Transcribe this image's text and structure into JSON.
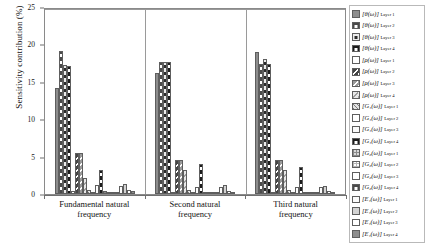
{
  "chart_data": {
    "type": "bar",
    "title": "",
    "xlabel": "",
    "ylabel": "Sensitivity contribution (%)",
    "ylim": [
      0,
      25
    ],
    "yticks": [
      0,
      5,
      10,
      15,
      20,
      25
    ],
    "grid": false,
    "legend_position": "right",
    "categories": [
      "Fundamental natural frequency",
      "Second natural frequency",
      "Third natural frequency"
    ],
    "series": [
      {
        "name": "[θ(ω)]_Layer 1",
        "base": "θ(ω)",
        "layer": "Layer 1",
        "fill": "grey-solid",
        "values": [
          14.3,
          16.4,
          19.2
        ]
      },
      {
        "name": "[θ(ω)]_Layer 2",
        "base": "θ(ω)",
        "layer": "Layer 2",
        "fill": "dark-dots",
        "values": [
          19.3,
          17.9,
          17.6
        ]
      },
      {
        "name": "[θ(ω)]_Layer 3",
        "base": "θ(ω)",
        "layer": "Layer 3",
        "fill": "white-dots",
        "values": [
          17.5,
          17.9,
          18.2
        ]
      },
      {
        "name": "[θ(ω)]_Layer 4",
        "base": "θ(ω)",
        "layer": "Layer 4",
        "fill": "black-dots",
        "values": [
          17.3,
          17.9,
          17.6
        ]
      },
      {
        "name": "[ρ(ω)]_Layer 1",
        "base": "ρ(ω)",
        "layer": "Layer 1",
        "fill": "white-plain",
        "values": [
          0.35,
          0.3,
          0.3
        ]
      },
      {
        "name": "[ρ(ω)]_Layer 2",
        "base": "ρ(ω)",
        "layer": "Layer 2",
        "fill": "dark-triangles",
        "values": [
          5.5,
          4.6,
          4.6
        ]
      },
      {
        "name": "[ρ(ω)]_Layer 3",
        "base": "ρ(ω)",
        "layer": "Layer 3",
        "fill": "grey-triangles",
        "values": [
          5.5,
          4.6,
          4.6
        ]
      },
      {
        "name": "[ρ(ω)]_Layer 4",
        "base": "ρ(ω)",
        "layer": "Layer 4",
        "fill": "light-triangles",
        "values": [
          2.2,
          3.3,
          3.3
        ]
      },
      {
        "name": "[G_1(ω)]_Layer 1",
        "base": "G_1(ω)",
        "layer": "Layer 1",
        "fill": "grey-hatch",
        "values": [
          0.5,
          0.5,
          0.5
        ]
      },
      {
        "name": "[G_1(ω)]_Layer 2",
        "base": "G_1(ω)",
        "layer": "Layer 2",
        "fill": "white-plain",
        "values": [
          0.3,
          0.3,
          0.3
        ]
      },
      {
        "name": "[G_1(ω)]_Layer 3",
        "base": "G_1(ω)",
        "layer": "Layer 3",
        "fill": "white-outline",
        "values": [
          1.2,
          1.0,
          0.9
        ]
      },
      {
        "name": "[G_1(ω)]_Layer 4",
        "base": "G_1(ω)",
        "layer": "Layer 4",
        "fill": "black-dots",
        "values": [
          3.3,
          4.0,
          3.6
        ]
      },
      {
        "name": "[G_2(ω)]_Layer 1",
        "base": "G_2(ω)",
        "layer": "Layer 1",
        "fill": "grey-grid",
        "values": [
          0.35,
          0.3,
          0.3
        ]
      },
      {
        "name": "[G_2(ω)]_Layer 2",
        "base": "G_2(ω)",
        "layer": "Layer 2",
        "fill": "white-grid",
        "values": [
          0.3,
          0.25,
          0.25
        ]
      },
      {
        "name": "[G_2(ω)]_Layer 3",
        "base": "G_2(ω)",
        "layer": "Layer 3",
        "fill": "white-plain",
        "values": [
          0.25,
          0.25,
          0.2
        ]
      },
      {
        "name": "[G_2(ω)]_Layer 4",
        "base": "G_2(ω)",
        "layer": "Layer 4",
        "fill": "dark-dots",
        "values": [
          0.3,
          0.3,
          0.25
        ]
      },
      {
        "name": "[E_1(ω)]_Layer 1",
        "base": "E_1(ω)",
        "layer": "Layer 1",
        "fill": "white-outline",
        "values": [
          1.1,
          1.0,
          1.0
        ]
      },
      {
        "name": "[E_1(ω)]_Layer 2",
        "base": "E_1(ω)",
        "layer": "Layer 2",
        "fill": "light-grey",
        "values": [
          1.3,
          1.2,
          1.1
        ]
      },
      {
        "name": "[E_1(ω)]_Layer 3",
        "base": "E_1(ω)",
        "layer": "Layer 3",
        "fill": "white-plain",
        "values": [
          0.5,
          0.45,
          0.4
        ]
      },
      {
        "name": "[E_1(ω)]_Layer 4",
        "base": "E_1(ω)",
        "layer": "Layer 4",
        "fill": "grey-solid",
        "values": [
          0.35,
          0.3,
          0.3
        ]
      }
    ]
  },
  "axis": {
    "y_title": "Sensitivity contribution (%)",
    "y_tick_labels": [
      "0",
      "5",
      "10",
      "15",
      "20",
      "25"
    ],
    "x_tick_labels": [
      "Fundamental natural\nfrequency",
      "Second natural\nfrequency",
      "Third natural\nfrequency"
    ]
  },
  "legend": {
    "items": [
      {
        "label": "[θ(ω)]",
        "sub": "Layer 1",
        "fill": "grey-solid"
      },
      {
        "label": "[θ(ω)]",
        "sub": "Layer 2",
        "fill": "dark-dots"
      },
      {
        "label": "[θ(ω)]",
        "sub": "Layer 3",
        "fill": "white-dots"
      },
      {
        "label": "[θ(ω)]",
        "sub": "Layer 4",
        "fill": "black-dots"
      },
      {
        "label": "[ρ(ω)]",
        "sub": "Layer 1",
        "fill": "white-plain"
      },
      {
        "label": "[ρ(ω)]",
        "sub": "Layer 2",
        "fill": "dark-triangles"
      },
      {
        "label": "[ρ(ω)]",
        "sub": "Layer 3",
        "fill": "grey-triangles"
      },
      {
        "label": "[ρ(ω)]",
        "sub": "Layer 4",
        "fill": "light-triangles"
      },
      {
        "label": "[G₁(ω)]",
        "sub": "Layer 1",
        "fill": "grey-hatch"
      },
      {
        "label": "[G₁(ω)]",
        "sub": "Layer 2",
        "fill": "white-plain"
      },
      {
        "label": "[G₁(ω)]",
        "sub": "Layer 3",
        "fill": "white-outline"
      },
      {
        "label": "[G₁(ω)]",
        "sub": "Layer 4",
        "fill": "black-dots"
      },
      {
        "label": "[G₂(ω)]",
        "sub": "Layer 1",
        "fill": "grey-grid"
      },
      {
        "label": "[G₂(ω)]",
        "sub": "Layer 2",
        "fill": "white-grid"
      },
      {
        "label": "[G₂(ω)]",
        "sub": "Layer 3",
        "fill": "white-plain"
      },
      {
        "label": "[G₂(ω)]",
        "sub": "Layer 4",
        "fill": "dark-dots"
      },
      {
        "label": "[E₁(ω)]",
        "sub": "Layer 1",
        "fill": "white-outline"
      },
      {
        "label": "[E₁(ω)]",
        "sub": "Layer 2",
        "fill": "light-grey"
      },
      {
        "label": "[E₁(ω)]",
        "sub": "Layer 3",
        "fill": "white-plain"
      },
      {
        "label": "[E₁(ω)]",
        "sub": "Layer 4",
        "fill": "grey-solid"
      }
    ]
  },
  "style": {
    "frame_color": "#8a8a8a",
    "axis_color": "#6f6f6f",
    "text_color": "#111111"
  }
}
